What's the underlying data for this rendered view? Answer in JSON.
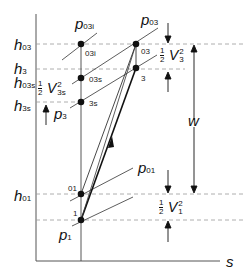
{
  "diagram": {
    "axes": {
      "x_label": "s",
      "y_label": ""
    },
    "y_levels": [
      {
        "symbol": "h",
        "subscript": "03"
      },
      {
        "symbol": "h",
        "subscript": "3"
      },
      {
        "symbol": "h",
        "subscript": "03s"
      },
      {
        "symbol": "h",
        "subscript": "3s"
      },
      {
        "symbol": "h",
        "subscript": "01"
      }
    ],
    "pressure_lines": [
      {
        "symbol": "p",
        "subscript": "03i"
      },
      {
        "symbol": "p",
        "subscript": "03"
      },
      {
        "symbol": "p",
        "subscript": "3"
      },
      {
        "symbol": "p",
        "subscript": "01"
      },
      {
        "symbol": "p",
        "subscript": "1"
      }
    ],
    "state_points": [
      "03i",
      "03s",
      "3s",
      "03",
      "3",
      "01",
      "1"
    ],
    "annotations": {
      "kinetic_exit": {
        "frac_num": "1",
        "frac_den": "2",
        "symbol": "V",
        "sup": "2",
        "sub": "3"
      },
      "kinetic_isentropic": {
        "frac_num": "1",
        "frac_den": "2",
        "symbol": "V",
        "sup": "2",
        "sub": "3s"
      },
      "kinetic_inlet": {
        "frac_num": "1",
        "frac_den": "2",
        "symbol": "V",
        "sup": "2",
        "sub": "1"
      },
      "work": "w"
    }
  }
}
